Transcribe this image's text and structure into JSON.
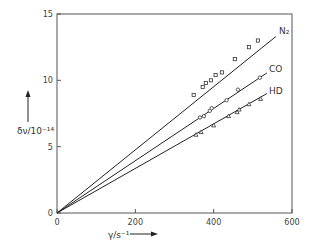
{
  "chart_data": {
    "type": "scatter",
    "title": "",
    "xlabel": "γ/s⁻¹",
    "ylabel": "δν/10⁻¹⁴",
    "xlim": [
      0,
      600
    ],
    "ylim": [
      0,
      15
    ],
    "xticks": [
      0,
      200,
      400,
      600
    ],
    "yticks": [
      0,
      5,
      10,
      15
    ],
    "grid": false,
    "legend": "inline labels at line ends",
    "series": [
      {
        "name": "N₂",
        "fit_slope": 0.0238,
        "fit_x_end": 559,
        "points": [
          [
            349,
            8.9
          ],
          [
            372,
            9.5
          ],
          [
            380,
            9.8
          ],
          [
            393,
            10.0
          ],
          [
            405,
            10.4
          ],
          [
            421,
            10.6
          ],
          [
            454,
            11.6
          ],
          [
            490,
            12.5
          ],
          [
            513,
            13.0
          ]
        ]
      },
      {
        "name": "CO",
        "fit_slope": 0.0197,
        "fit_x_end": 536,
        "points": [
          [
            365,
            7.2
          ],
          [
            375,
            7.3
          ],
          [
            390,
            7.7
          ],
          [
            395,
            7.9
          ],
          [
            433,
            8.5
          ],
          [
            462,
            9.3
          ],
          [
            518,
            10.2
          ]
        ]
      },
      {
        "name": "HD",
        "fit_slope": 0.0168,
        "fit_x_end": 536,
        "points": [
          [
            355,
            5.9
          ],
          [
            368,
            6.1
          ],
          [
            400,
            6.6
          ],
          [
            438,
            7.3
          ],
          [
            460,
            7.6
          ],
          [
            465,
            7.8
          ],
          [
            490,
            8.2
          ],
          [
            520,
            8.6
          ]
        ]
      }
    ]
  },
  "labels": {
    "n2": "N₂",
    "co": "CO",
    "hd": "HD",
    "xaxis": "γ/s⁻¹",
    "yaxis": "δν/10⁻¹⁴"
  }
}
